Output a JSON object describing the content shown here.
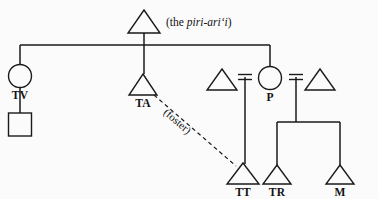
{
  "figure": {
    "type": "kinship-diagram",
    "background_color": "#fbfbfb",
    "ink_color": "#1a1a1a"
  },
  "annotations": {
    "apex_note_prefix": "(the ",
    "apex_note_italic": "piri-ari‘i",
    "apex_note_suffix": ")",
    "foster_label": "(foster)"
  },
  "nodes": {
    "apex": {
      "label": "",
      "shape": "triangle",
      "cx": 144,
      "cy": 22
    },
    "tv": {
      "label": "TV",
      "shape": "circle",
      "cx": 20,
      "cy": 76
    },
    "tv_child": {
      "label": "",
      "shape": "square",
      "cx": 20,
      "cy": 129
    },
    "ta": {
      "label": "TA",
      "shape": "triangle",
      "cx": 143,
      "cy": 84
    },
    "p_husband1": {
      "label": "",
      "shape": "triangle",
      "cx": 222,
      "cy": 80
    },
    "p": {
      "label": "P",
      "shape": "circle",
      "cx": 270,
      "cy": 78
    },
    "p_husband2": {
      "label": "",
      "shape": "triangle",
      "cx": 320,
      "cy": 80
    },
    "tt": {
      "label": "TT",
      "shape": "triangle",
      "cx": 243,
      "cy": 174
    },
    "tr": {
      "label": "TR",
      "shape": "triangle",
      "cx": 277,
      "cy": 176
    },
    "m": {
      "label": "M",
      "shape": "triangle",
      "cx": 340,
      "cy": 176
    }
  },
  "relations": {
    "marriage_left": {
      "from": "p_husband1",
      "to": "p",
      "child": "tt"
    },
    "marriage_right": {
      "from": "p",
      "to": "p_husband2",
      "children": [
        "tr",
        "m"
      ]
    },
    "descent_apex": {
      "from": "apex",
      "to": [
        "tv",
        "ta",
        "p"
      ]
    },
    "descent_tv": {
      "from": "tv",
      "to": "tv_child"
    },
    "foster": {
      "from": "ta",
      "to": "tt",
      "style": "dashed"
    }
  }
}
